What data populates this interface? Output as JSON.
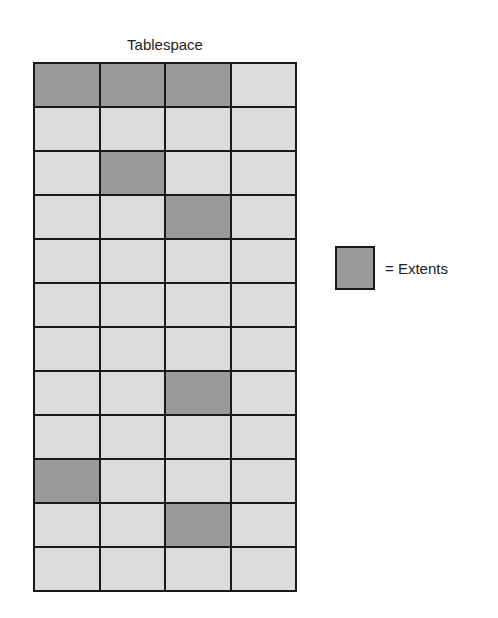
{
  "title": "Tablespace",
  "grid": {
    "columns": 4,
    "rows": 12,
    "extent_cells": [
      [
        0,
        0
      ],
      [
        0,
        1
      ],
      [
        0,
        2
      ],
      [
        2,
        1
      ],
      [
        3,
        2
      ],
      [
        7,
        2
      ],
      [
        9,
        0
      ],
      [
        10,
        2
      ]
    ]
  },
  "legend": {
    "label": "= Extents"
  },
  "colors": {
    "extent": "#9a9a9a",
    "empty": "#dcdcdc",
    "border": "#1a1a1a"
  }
}
